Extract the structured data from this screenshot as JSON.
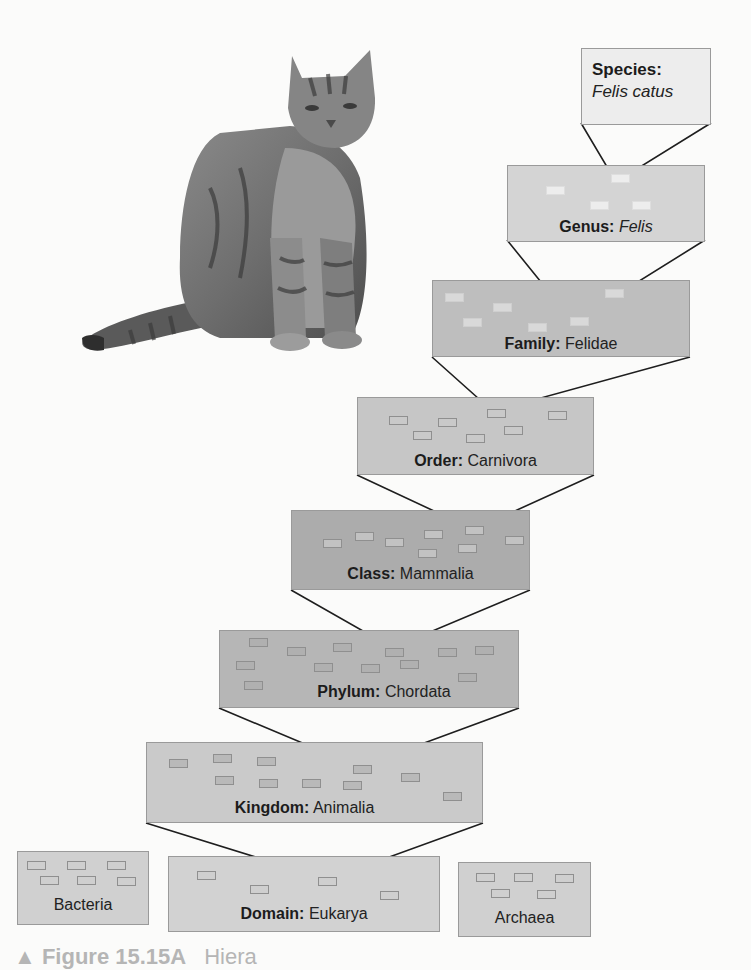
{
  "figure": {
    "caption_prefix": "▲ Figure 15.15A",
    "caption_rest": "Hiera"
  },
  "image": {
    "subject": "domestic tabby cat (sitting)"
  },
  "levels": [
    {
      "id": "species",
      "rank": "Species:",
      "name": "Felis catus",
      "italic": true,
      "fill": "#ededed",
      "chip_fill": "#f6f6f6"
    },
    {
      "id": "genus",
      "rank": "Genus:",
      "name": "Felis",
      "italic": true,
      "fill": "#d4d4d4",
      "chip_fill": "#ededed"
    },
    {
      "id": "family",
      "rank": "Family:",
      "name": "Felidae",
      "italic": false,
      "fill": "#bebebe",
      "chip_fill": "#d9d9d9"
    },
    {
      "id": "order",
      "rank": "Order:",
      "name": "Carnivora",
      "italic": false,
      "fill": "#c6c6c6",
      "chip_fill": "#c9c9c9"
    },
    {
      "id": "class",
      "rank": "Class:",
      "name": "Mammalia",
      "italic": false,
      "fill": "#acacac",
      "chip_fill": "#c2c2c2"
    },
    {
      "id": "phylum",
      "rank": "Phylum:",
      "name": "Chordata",
      "italic": false,
      "fill": "#b6b6b6",
      "chip_fill": "#b0b0b0"
    },
    {
      "id": "kingdom",
      "rank": "Kingdom:",
      "name": "Animalia",
      "italic": false,
      "fill": "#cacaca",
      "chip_fill": "#b9b9b9"
    },
    {
      "id": "domain",
      "rank": "Domain:",
      "name": "Eukarya",
      "italic": false,
      "fill": "#d2d2d2",
      "chip_fill": "#cfcfcf"
    }
  ],
  "other_domains": [
    {
      "id": "bacteria",
      "name": "Bacteria",
      "fill": "#d0d0d0"
    },
    {
      "id": "archaea",
      "name": "Archaea",
      "fill": "#d0d0d0"
    }
  ],
  "colors": {
    "connector": "#1e1e1e",
    "text": "#222222",
    "border": "#9a9a9a"
  }
}
